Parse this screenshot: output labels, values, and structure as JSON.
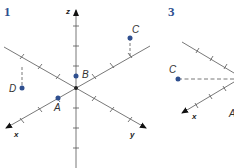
{
  "figures": [
    {
      "number": "1",
      "axes": {
        "x": "x",
        "y": "y",
        "z": "z"
      },
      "points": [
        {
          "label": "A",
          "color": "#2f4f8f"
        },
        {
          "label": "B",
          "color": "#2f4f8f"
        },
        {
          "label": "C",
          "color": "#2f4f8f"
        },
        {
          "label": "D",
          "color": "#2f4f8f"
        }
      ]
    },
    {
      "number": "3",
      "axes": {
        "x": "x"
      },
      "points": [
        {
          "label": "C",
          "color": "#2f4f8f"
        },
        {
          "label": "A",
          "color": "#2f4f8f"
        }
      ]
    }
  ],
  "colors": {
    "axis": "#555555",
    "point": "#2f4f8f",
    "number": "#2f4f8f"
  }
}
